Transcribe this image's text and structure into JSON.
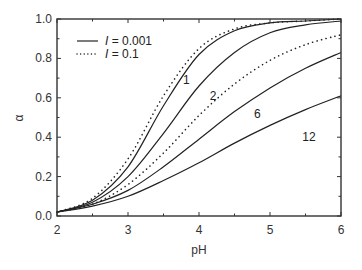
{
  "chart_data": {
    "type": "line",
    "title": "",
    "xlabel": "pH",
    "ylabel": "α",
    "xlim": [
      2,
      6
    ],
    "ylim": [
      0.0,
      1.0
    ],
    "grid": false,
    "legend_position": "upper left",
    "x_ticks": [
      "2",
      "3",
      "4",
      "5",
      "6"
    ],
    "y_ticks": [
      "0.0",
      "0.2",
      "0.4",
      "0.6",
      "0.8",
      "1.0"
    ],
    "legend": [
      {
        "style": "solid",
        "label_var": "I",
        "label_value": "= 0.001"
      },
      {
        "style": "dotted",
        "label_var": "I",
        "label_value": "= 0.1"
      }
    ],
    "x": [
      2.0,
      2.5,
      3.0,
      3.5,
      4.0,
      4.5,
      5.0,
      5.5,
      6.0
    ],
    "series": [
      {
        "name": "1 (I = 0.001)",
        "curve_label": "1",
        "style": "solid",
        "values": [
          0.02,
          0.08,
          0.25,
          0.56,
          0.82,
          0.94,
          0.98,
          0.99,
          1.0
        ]
      },
      {
        "name": "1 (I = 0.1)",
        "curve_label": "1",
        "style": "dotted",
        "values": [
          0.02,
          0.09,
          0.29,
          0.61,
          0.85,
          0.95,
          0.98,
          0.99,
          1.0
        ]
      },
      {
        "name": "2 (I = 0.001)",
        "curve_label": "2",
        "style": "solid",
        "values": [
          0.02,
          0.07,
          0.2,
          0.42,
          0.66,
          0.83,
          0.93,
          0.97,
          0.99
        ]
      },
      {
        "name": "6 (I = 0.1)",
        "curve_label": "6",
        "style": "dotted",
        "values": [
          0.02,
          0.06,
          0.16,
          0.32,
          0.51,
          0.67,
          0.79,
          0.87,
          0.92
        ]
      },
      {
        "name": "6 (I = 0.001)",
        "curve_label": "6",
        "style": "solid",
        "values": [
          0.02,
          0.06,
          0.13,
          0.25,
          0.39,
          0.53,
          0.65,
          0.75,
          0.83
        ]
      },
      {
        "name": "12 (I = 0.001)",
        "curve_label": "12",
        "style": "solid",
        "values": [
          0.02,
          0.05,
          0.1,
          0.18,
          0.27,
          0.37,
          0.46,
          0.54,
          0.61
        ]
      }
    ],
    "annotations": [
      {
        "text": "1",
        "x": 3.82,
        "y": 0.67
      },
      {
        "text": "2",
        "x": 4.2,
        "y": 0.59
      },
      {
        "text": "6",
        "x": 4.82,
        "y": 0.5
      },
      {
        "text": "12",
        "x": 5.55,
        "y": 0.38
      }
    ]
  },
  "colors": {
    "line": "#222222",
    "frame": "#333333",
    "background": "#ffffff"
  }
}
